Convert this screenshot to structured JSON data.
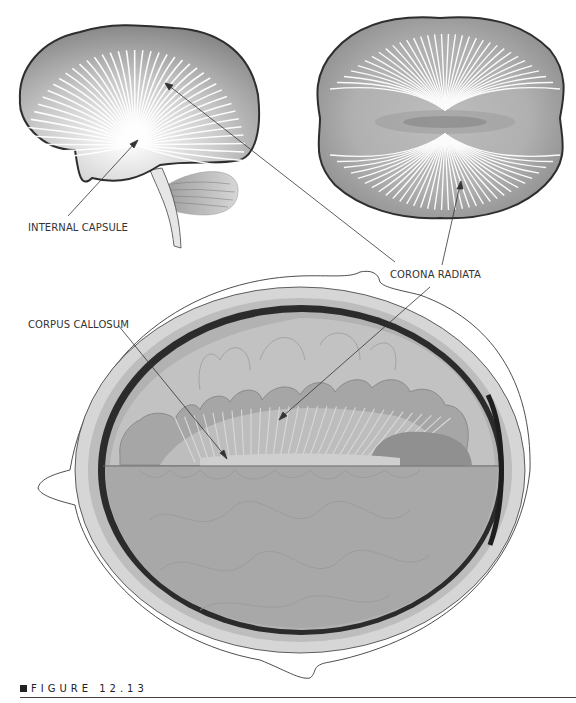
{
  "figure": {
    "caption_label": "FIGURE 12.13",
    "colors": {
      "outline": "#333333",
      "brain_fill_dark": "#8a8a8a",
      "brain_fill_light": "#e8e8e8",
      "fiber": "#ffffff",
      "skull": "#cfcfcf",
      "meninges": "#2a2a2a",
      "tissue": "#a9a9a9"
    }
  },
  "labels": {
    "internal_capsule": "INTERNAL CAPSULE",
    "corona_radiata": "CORONA RADIATA",
    "corpus_callosum": "CORPUS CALLOSUM"
  },
  "panels": [
    {
      "name": "lateral-view",
      "description": "Sagittal brain with radiating fibers"
    },
    {
      "name": "superior-view",
      "description": "Top-down brain with radiating fibers"
    },
    {
      "name": "coronal-section",
      "description": "Head cross-section showing corpus callosum and corona radiata"
    }
  ]
}
